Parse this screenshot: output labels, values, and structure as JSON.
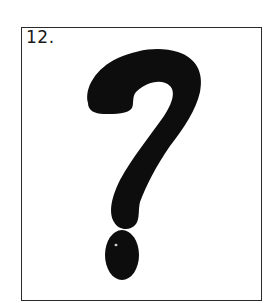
{
  "card": {
    "number_label": "12.",
    "symbol": "question-mark",
    "border_color": "#2a2a2a",
    "ink_color": "#0d0d0d",
    "background": "#ffffff"
  }
}
